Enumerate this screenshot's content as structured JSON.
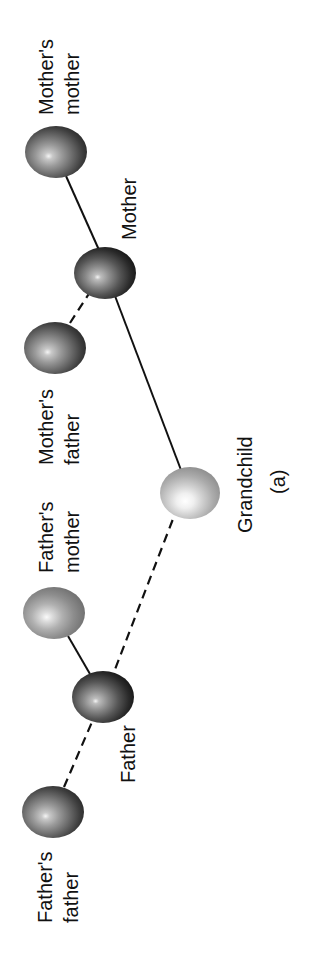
{
  "diagram": {
    "type": "pedigree",
    "orientation": "rotated-90-ccw",
    "panel_label": "(a)",
    "nodes": [
      {
        "id": "mothers_mother",
        "label_line1": "Mother's",
        "label_line2": "mother",
        "shade": "dark"
      },
      {
        "id": "mother",
        "label_line1": "Mother",
        "label_line2": "",
        "shade": "darkest"
      },
      {
        "id": "mothers_father",
        "label_line1": "Mother's",
        "label_line2": "father",
        "shade": "dark"
      },
      {
        "id": "grandchild",
        "label_line1": "Grandchild",
        "label_line2": "",
        "shade": "light"
      },
      {
        "id": "fathers_mother",
        "label_line1": "Father's",
        "label_line2": "mother",
        "shade": "medium"
      },
      {
        "id": "father",
        "label_line1": "Father",
        "label_line2": "",
        "shade": "darkest"
      },
      {
        "id": "fathers_father",
        "label_line1": "Father's",
        "label_line2": "father",
        "shade": "dark"
      }
    ],
    "edges": [
      {
        "from": "mothers_mother",
        "to": "mother",
        "style": "solid"
      },
      {
        "from": "mothers_father",
        "to": "mother",
        "style": "dashed"
      },
      {
        "from": "mother",
        "to": "grandchild",
        "style": "solid"
      },
      {
        "from": "father",
        "to": "grandchild",
        "style": "dashed"
      },
      {
        "from": "fathers_mother",
        "to": "father",
        "style": "solid"
      },
      {
        "from": "fathers_father",
        "to": "father",
        "style": "dashed"
      }
    ]
  }
}
